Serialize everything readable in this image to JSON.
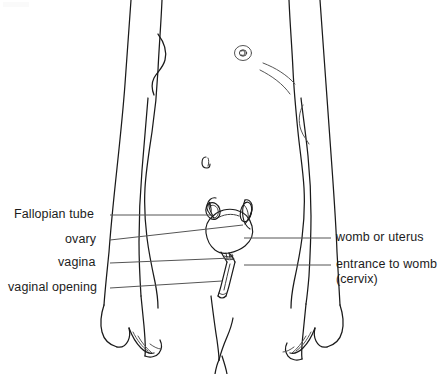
{
  "figure": {
    "background_color": "#ffffff",
    "line_color": "#1a1a1a",
    "leader_color": "#555555",
    "text_color": "#1c1c1c"
  },
  "labels": {
    "left": [
      {
        "id": "fallopian-tube",
        "text": "Fallopian tube",
        "x": 14,
        "y": 208,
        "leader": {
          "x1": 110,
          "y1": 215,
          "x2": 213,
          "y2": 215
        }
      },
      {
        "id": "ovary",
        "text": "ovary",
        "x": 65,
        "y": 233,
        "leader": {
          "x1": 110,
          "y1": 240,
          "x2": 243,
          "y2": 225
        }
      },
      {
        "id": "vagina",
        "text": "vagina",
        "x": 58,
        "y": 256,
        "leader": {
          "x1": 110,
          "y1": 263,
          "x2": 232,
          "y2": 258
        }
      },
      {
        "id": "vaginal-opening",
        "text": "vaginal opening",
        "x": 8,
        "y": 281,
        "leader": {
          "x1": 110,
          "y1": 288,
          "x2": 222,
          "y2": 281
        }
      }
    ],
    "right": [
      {
        "id": "womb-or-uterus",
        "text": "womb or uterus",
        "x": 336,
        "y": 231,
        "leader": {
          "x1": 244,
          "y1": 238,
          "x2": 331,
          "y2": 238
        }
      },
      {
        "id": "entrance-to-womb",
        "text": "entrance to womb",
        "text_line2": "(cervix)",
        "x": 336,
        "y": 258,
        "leader": {
          "x1": 244,
          "y1": 265,
          "x2": 331,
          "y2": 265
        }
      }
    ]
  },
  "organs": {
    "uterus": "womb or uterus",
    "cervix": "entrance to womb (cervix)",
    "vagina": "vagina",
    "vaginal_opening": "vaginal opening",
    "ovary": "ovary",
    "fallopian_tube": "Fallopian tube"
  }
}
